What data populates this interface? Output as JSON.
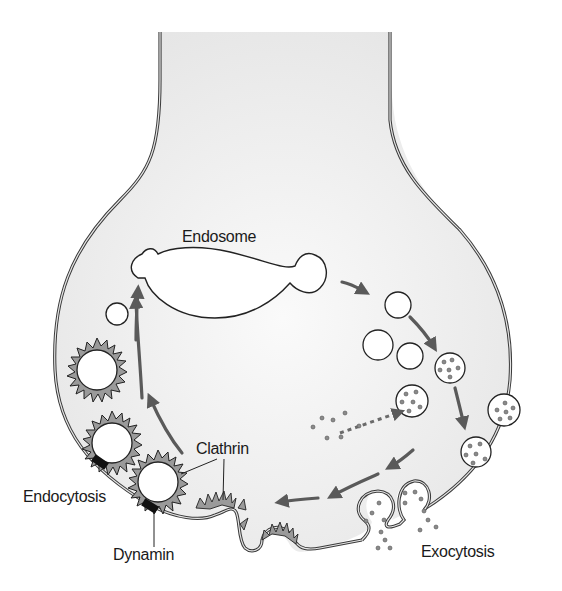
{
  "diagram": {
    "type": "synaptic-vesicle-recycling",
    "labels": {
      "endosome": "Endosome",
      "clathrin": "Clathrin",
      "endocytosis": "Endocytosis",
      "dynamin": "Dynamin",
      "exocytosis": "Exocytosis"
    },
    "colors": {
      "terminal_fill": "#ececec",
      "membrane_stroke": "#3a3a3a",
      "arrow": "#5a5a5a",
      "clathrin_coat": "#9a9a9a",
      "dynamin": "#111111",
      "vesicle_fill": "#ffffff",
      "transmitter_dot": "#8a8a8a",
      "text": "#1a1a1a"
    },
    "components": [
      "presynaptic-terminal",
      "endosome",
      "empty-vesicles",
      "filled-vesicles",
      "docked-vesicles",
      "fusing-vesicles",
      "clathrin-coated-vesicles",
      "clathrin-coated-pits",
      "dynamin-collar",
      "transmitter-uptake"
    ]
  }
}
